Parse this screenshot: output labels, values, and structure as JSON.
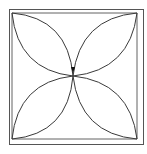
{
  "diagram": {
    "stroke_color": "#3a3a3a",
    "frame_color": "#555555",
    "background": "#ffffff",
    "petal_count": 4,
    "center_marker": "arrow-down"
  }
}
